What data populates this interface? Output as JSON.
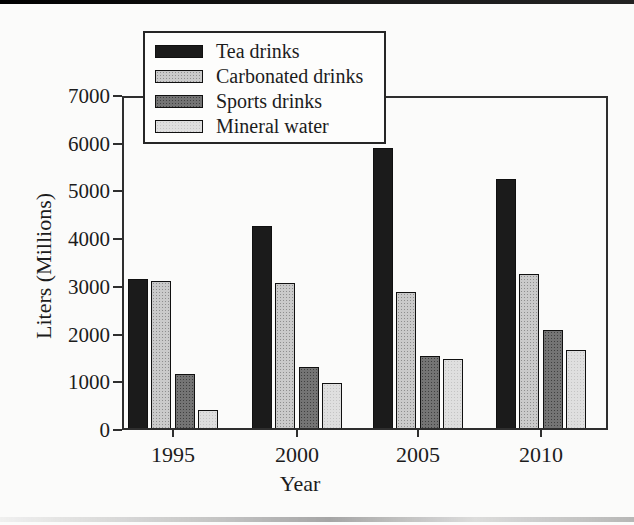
{
  "chart_data": {
    "type": "bar",
    "title": "",
    "xlabel": "Year",
    "ylabel": "Liters (Millions)",
    "categories": [
      "1995",
      "2000",
      "2005",
      "2010"
    ],
    "series": [
      {
        "name": "Tea drinks",
        "pattern": "solid",
        "fill": "#1b1b1b",
        "dot": "#1b1b1b",
        "values": [
          3170,
          4270,
          5900,
          5270
        ]
      },
      {
        "name": "Carbonated drinks",
        "pattern": "dots",
        "fill": "#cacaca",
        "dot": "#8e8e8e",
        "values": [
          3130,
          3090,
          2900,
          3270
        ]
      },
      {
        "name": "Sports drinks",
        "pattern": "dots",
        "fill": "#747474",
        "dot": "#404040",
        "values": [
          1180,
          1320,
          1550,
          2090
        ]
      },
      {
        "name": "Mineral water",
        "pattern": "dots",
        "fill": "#dfdfdf",
        "dot": "#c4c4c4",
        "values": [
          420,
          980,
          1490,
          1670
        ]
      }
    ],
    "ylim": [
      0,
      7000
    ],
    "yticks": [
      0,
      1000,
      2000,
      3000,
      4000,
      5000,
      6000,
      7000
    ],
    "grid": false,
    "legend_position": "upper-left-overlay",
    "axis_color": "#2e2e2e",
    "text_color": "#1c1c1c"
  }
}
